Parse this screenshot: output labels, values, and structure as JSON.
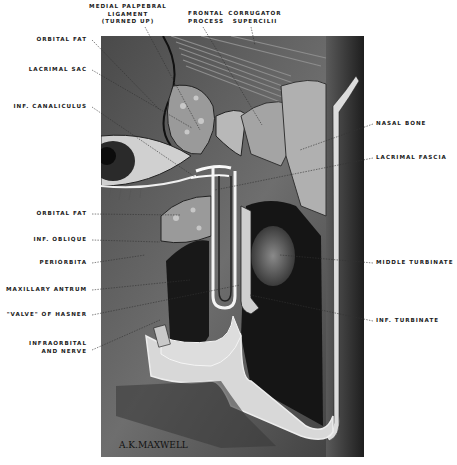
{
  "figure": {
    "signature": "A.K.MAXWELL",
    "colors": {
      "background": "#ffffff",
      "ink": "#1a1a1a",
      "skin_dark": "#3a3a3a",
      "skin_mid": "#6b6b6b",
      "bone": "#d9d9d9",
      "cavity": "#141414"
    }
  },
  "labels": {
    "top": [
      {
        "id": "medial-palpebral-ligament",
        "lines": [
          "MEDIAL PALPEBRAL",
          "LIGAMENT",
          "(TURNED UP)"
        ]
      },
      {
        "id": "frontal-process",
        "lines": [
          "FRONTAL",
          "PROCESS"
        ]
      },
      {
        "id": "corrugator-supercilii",
        "lines": [
          "CORRUGATOR",
          "SUPERCILII"
        ]
      }
    ],
    "left": [
      {
        "id": "orbital-fat-upper",
        "lines": [
          "ORBITAL FAT"
        ]
      },
      {
        "id": "lacrimal-sac",
        "lines": [
          "LACRIMAL SAC"
        ]
      },
      {
        "id": "inf-canaliculus",
        "lines": [
          "INF. CANALICULUS"
        ]
      },
      {
        "id": "orbital-fat-lower",
        "lines": [
          "ORBITAL FAT"
        ]
      },
      {
        "id": "inf-oblique",
        "lines": [
          "INF. OBLIQUE"
        ]
      },
      {
        "id": "periorbita",
        "lines": [
          "PERIORBITA"
        ]
      },
      {
        "id": "maxillary-antrum",
        "lines": [
          "MAXILLARY ANTRUM"
        ]
      },
      {
        "id": "valve-of-hasner",
        "lines": [
          "\"VALVE\" OF HASNER"
        ]
      },
      {
        "id": "infraorbital-and-nerve",
        "lines": [
          "INFRAORBITAL",
          "AND NERVE"
        ]
      }
    ],
    "right": [
      {
        "id": "nasal-bone",
        "lines": [
          "NASAL BONE"
        ]
      },
      {
        "id": "lacrimal-fascia",
        "lines": [
          "LACRIMAL FASCIA"
        ]
      },
      {
        "id": "middle-turbinate",
        "lines": [
          "MIDDLE TURBINATE"
        ]
      },
      {
        "id": "inf-turbinate",
        "lines": [
          "INF. TURBINATE"
        ]
      }
    ]
  }
}
